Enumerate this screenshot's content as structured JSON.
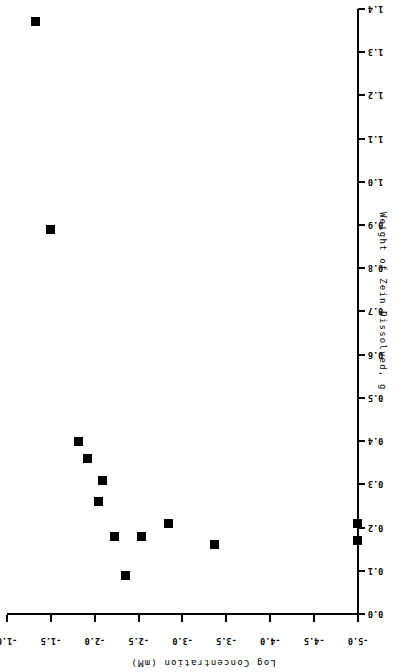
{
  "chart_data": {
    "type": "scatter",
    "title": "",
    "xlabel": "Log Concentration (mM)",
    "ylabel": "Weight of Zein Dissolved, g",
    "xlim": [
      -5.0,
      -1.0
    ],
    "ylim": [
      0.0,
      1.4
    ],
    "grid": false,
    "legend": null,
    "orientation_note": "figure printed upside-down (rotated 180 degrees)",
    "x_ticks": [
      -5.0,
      -4.5,
      -4.0,
      -3.5,
      -3.0,
      -2.5,
      -2.0,
      -1.5,
      -1.0
    ],
    "x_tick_labels": [
      "-5.0",
      "-4.5",
      "-4.0",
      "-3.5",
      "-3.0",
      "-2.5",
      "-2.0",
      "-1.5",
      "-1.0"
    ],
    "y_ticks": [
      0.0,
      0.1,
      0.2,
      0.3,
      0.4,
      0.5,
      0.6,
      0.7,
      0.8,
      0.9,
      1.0,
      1.1,
      1.2,
      1.3,
      1.4
    ],
    "y_tick_labels": [
      "0.0",
      "0.1",
      "0.2",
      "0.3",
      "0.4",
      "0.5",
      "0.6",
      "0.7",
      "0.8",
      "0.9",
      "1.0",
      "1.1",
      "1.2",
      "1.3",
      "1.4"
    ],
    "series": [
      {
        "name": "Zein solubility",
        "marker": "filled-square",
        "color": "#000000",
        "points": [
          {
            "x": -1.33,
            "y": 1.37
          },
          {
            "x": -1.5,
            "y": 0.89
          },
          {
            "x": -1.81,
            "y": 0.4
          },
          {
            "x": -1.92,
            "y": 0.36
          },
          {
            "x": -2.04,
            "y": 0.26
          },
          {
            "x": -2.09,
            "y": 0.31
          },
          {
            "x": -2.23,
            "y": 0.18
          },
          {
            "x": -2.35,
            "y": 0.09
          },
          {
            "x": -2.53,
            "y": 0.18
          },
          {
            "x": -2.84,
            "y": 0.21
          },
          {
            "x": -3.37,
            "y": 0.16
          },
          {
            "x": -5.0,
            "y": 0.21
          },
          {
            "x": -5.0,
            "y": 0.17
          }
        ]
      }
    ]
  }
}
